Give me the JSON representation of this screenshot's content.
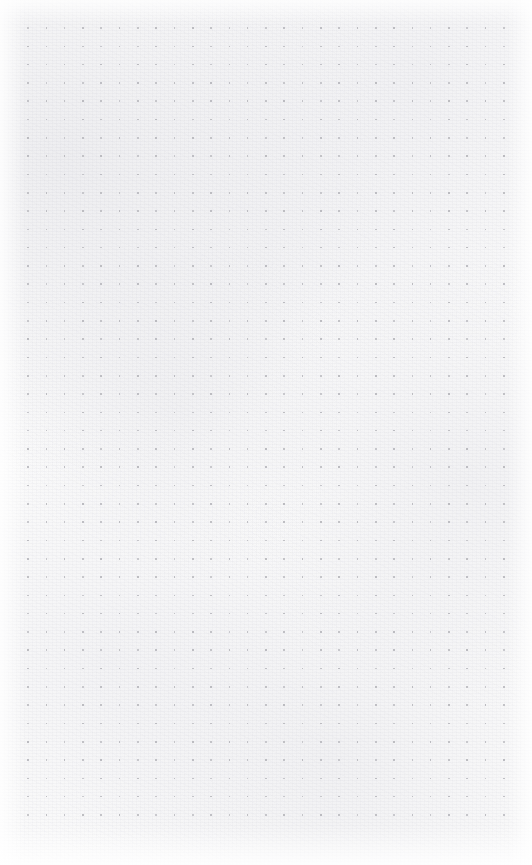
{
  "page": {
    "kind": "dot-grid-notebook-page",
    "width": 532,
    "height": 865,
    "background_color": "#fbfbfb",
    "paper_tone": "off-white",
    "has_text_content": false,
    "content_text": ""
  },
  "grid": {
    "dot_color": "#b9b9be",
    "dot_size_px": 1.6,
    "spacing_px": 18.3,
    "columns": 27,
    "rows": 44,
    "origin_x_px": 28,
    "origin_y_px": 28,
    "last_column_x_px": 507,
    "last_row_y_px": 825,
    "shape": "square"
  },
  "margins": {
    "left_px": 28,
    "top_px": 28,
    "right_px": 25,
    "bottom_px": 40
  },
  "texture": {
    "grain_color": "#e6e6ea",
    "vignette_color": "#ffffff",
    "description": "subtle fibrous paper grain with lighter edges"
  }
}
